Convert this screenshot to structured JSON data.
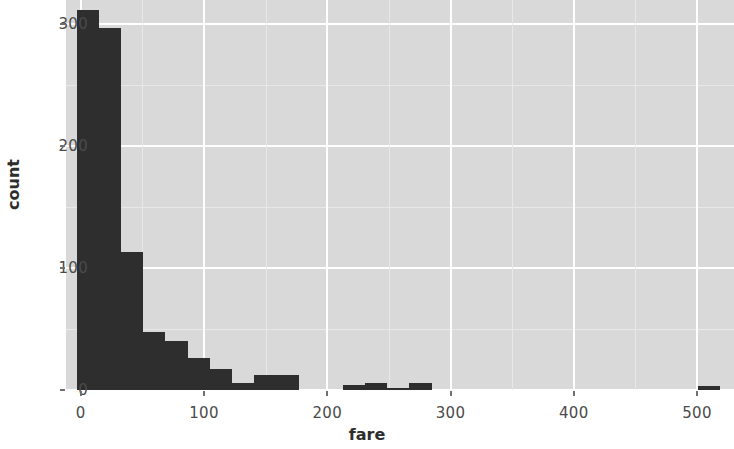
{
  "chart_data": {
    "type": "bar",
    "title": "",
    "subtitle": "",
    "xlabel": "fare",
    "ylabel": "count",
    "xlim": [
      -12,
      530
    ],
    "ylim": [
      0,
      320
    ],
    "x_ticks": [
      0,
      100,
      200,
      300,
      400,
      500
    ],
    "x_tick_labels": [
      "0",
      "100",
      "200",
      "300",
      "400",
      "500"
    ],
    "y_ticks": [
      0,
      100,
      200,
      300
    ],
    "y_tick_labels": [
      "0",
      "100",
      "200",
      "300"
    ],
    "grid": true,
    "legend": "none",
    "bin_width": 18,
    "bar_color": "#2e2e2e",
    "panel_color": "#d9d9d9",
    "gridline_color": "#ffffff",
    "bins": [
      {
        "x0": -3.3,
        "x1": 14.7,
        "count": 312
      },
      {
        "x0": 14.7,
        "x1": 32.7,
        "count": 297
      },
      {
        "x0": 32.7,
        "x1": 50.7,
        "count": 113
      },
      {
        "x0": 50.7,
        "x1": 68.7,
        "count": 48
      },
      {
        "x0": 68.7,
        "x1": 86.7,
        "count": 40
      },
      {
        "x0": 86.7,
        "x1": 104.7,
        "count": 26
      },
      {
        "x0": 104.7,
        "x1": 122.7,
        "count": 17
      },
      {
        "x0": 122.7,
        "x1": 140.7,
        "count": 6
      },
      {
        "x0": 140.7,
        "x1": 158.7,
        "count": 12
      },
      {
        "x0": 158.7,
        "x1": 176.7,
        "count": 12
      },
      {
        "x0": 176.7,
        "x1": 194.7,
        "count": 0
      },
      {
        "x0": 194.7,
        "x1": 212.7,
        "count": 0
      },
      {
        "x0": 212.7,
        "x1": 230.7,
        "count": 4
      },
      {
        "x0": 230.7,
        "x1": 248.7,
        "count": 6
      },
      {
        "x0": 248.7,
        "x1": 266.7,
        "count": 2
      },
      {
        "x0": 266.7,
        "x1": 284.7,
        "count": 6
      },
      {
        "x0": 284.7,
        "x1": 302.7,
        "count": 0
      },
      {
        "x0": 302.7,
        "x1": 320.7,
        "count": 0
      },
      {
        "x0": 320.7,
        "x1": 338.7,
        "count": 0
      },
      {
        "x0": 338.7,
        "x1": 356.7,
        "count": 0
      },
      {
        "x0": 356.7,
        "x1": 374.7,
        "count": 0
      },
      {
        "x0": 374.7,
        "x1": 392.7,
        "count": 0
      },
      {
        "x0": 392.7,
        "x1": 410.7,
        "count": 0
      },
      {
        "x0": 410.7,
        "x1": 428.7,
        "count": 0
      },
      {
        "x0": 428.7,
        "x1": 446.7,
        "count": 0
      },
      {
        "x0": 446.7,
        "x1": 464.7,
        "count": 0
      },
      {
        "x0": 464.7,
        "x1": 482.7,
        "count": 0
      },
      {
        "x0": 482.7,
        "x1": 500.7,
        "count": 0
      },
      {
        "x0": 500.7,
        "x1": 518.7,
        "count": 3
      }
    ]
  }
}
